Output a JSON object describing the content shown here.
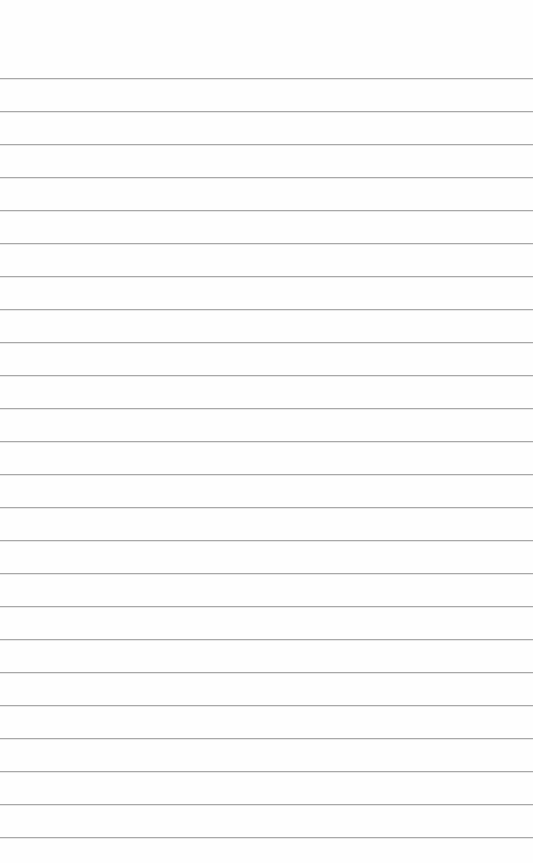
{
  "sheet": {
    "type": "ruled-paper",
    "background_color": "#fefefe",
    "line_color": "#a8a8a8",
    "first_line_y": 78,
    "line_spacing": 33,
    "line_count": 24
  }
}
